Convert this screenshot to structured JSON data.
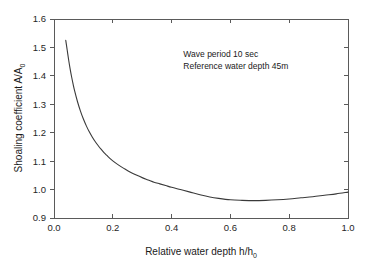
{
  "chart_data": {
    "type": "line",
    "title": "",
    "xlabel": "Relative water depth h/h0",
    "xlabel_main": "Relative water depth h/h",
    "xlabel_sub": "0",
    "ylabel": "Shoaling coefficient A/A0",
    "ylabel_main": "Shoaling coefficient A/A",
    "ylabel_sub": "0",
    "xlim": [
      0.0,
      1.0
    ],
    "ylim": [
      0.9,
      1.6
    ],
    "xticks": [
      "0.0",
      "0.2",
      "0.4",
      "0.6",
      "0.8",
      "1.0"
    ],
    "xtick_values": [
      0.0,
      0.2,
      0.4,
      0.6,
      0.8,
      1.0
    ],
    "yticks": [
      "0.9",
      "1.0",
      "1.1",
      "1.2",
      "1.3",
      "1.4",
      "1.5",
      "1.6"
    ],
    "ytick_values": [
      0.9,
      1.0,
      1.1,
      1.2,
      1.3,
      1.4,
      1.5,
      1.6
    ],
    "grid": false,
    "legend": null,
    "line_color": "#3a3a3a",
    "frame_color": "#5a5a5a",
    "series": [
      {
        "name": "Shoaling coefficient",
        "x": [
          0.04,
          0.045,
          0.05,
          0.055,
          0.06,
          0.065,
          0.07,
          0.08,
          0.09,
          0.1,
          0.11,
          0.12,
          0.13,
          0.14,
          0.15,
          0.16,
          0.17,
          0.18,
          0.19,
          0.2,
          0.22,
          0.24,
          0.26,
          0.28,
          0.3,
          0.32,
          0.34,
          0.36,
          0.38,
          0.4,
          0.43,
          0.46,
          0.5,
          0.53,
          0.56,
          0.6,
          0.64,
          0.68,
          0.72,
          0.76,
          0.8,
          0.84,
          0.88,
          0.92,
          0.96,
          1.0
        ],
        "y": [
          1.525,
          1.49,
          1.455,
          1.424,
          1.396,
          1.371,
          1.348,
          1.309,
          1.276,
          1.248,
          1.224,
          1.203,
          1.185,
          1.169,
          1.155,
          1.142,
          1.13,
          1.12,
          1.11,
          1.101,
          1.086,
          1.073,
          1.061,
          1.051,
          1.042,
          1.034,
          1.026,
          1.02,
          1.014,
          1.008,
          1.0,
          0.992,
          0.981,
          0.974,
          0.969,
          0.964,
          0.962,
          0.961,
          0.962,
          0.964,
          0.967,
          0.971,
          0.975,
          0.98,
          0.985,
          0.991
        ]
      }
    ],
    "annotations": [
      {
        "text": "Wave period 10 sec",
        "x": 0.44,
        "y": 1.465
      },
      {
        "text": "Reference water depth 45m",
        "x": 0.44,
        "y": 1.425
      }
    ]
  },
  "plot_geometry": {
    "left": 54,
    "right": 348,
    "top": 19,
    "bottom": 218
  }
}
